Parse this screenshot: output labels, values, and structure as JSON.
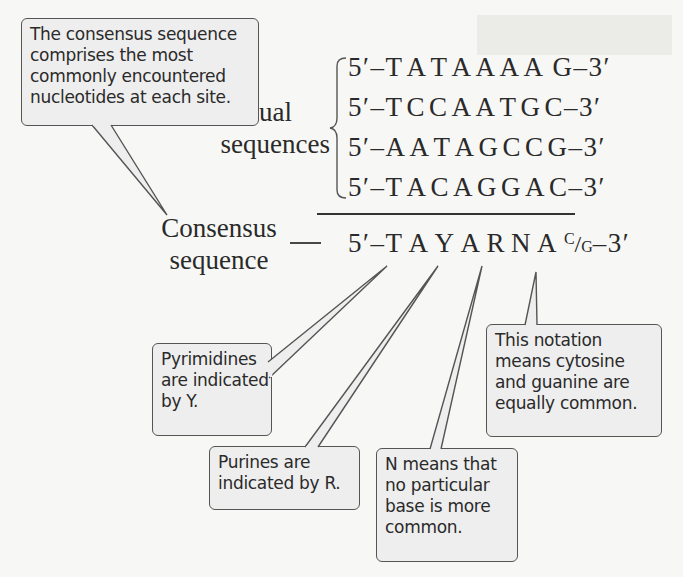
{
  "figure": {
    "top_callout": {
      "lines": [
        "The consensus sequence",
        "comprises the most",
        "commonly encountered",
        "nucleotides at each site."
      ]
    },
    "actual_label": {
      "line1": "Actual",
      "line2": "sequences"
    },
    "actual_sequences": [
      {
        "prefix": "5′–",
        "bases": [
          "T",
          "A",
          "T",
          "A",
          "A",
          "A",
          "A",
          "G"
        ],
        "suffix": "–3′"
      },
      {
        "prefix": "5′–",
        "bases": [
          "T",
          "C",
          "C",
          "A",
          "A",
          "T",
          "G",
          "C"
        ],
        "suffix": "–3′"
      },
      {
        "prefix": "5′–",
        "bases": [
          "A",
          "A",
          "T",
          "A",
          "G",
          "C",
          "C",
          "G"
        ],
        "suffix": "–3′"
      },
      {
        "prefix": "5′–",
        "bases": [
          "T",
          "A",
          "C",
          "A",
          "G",
          "G",
          "A",
          "C"
        ],
        "suffix": "–3′"
      }
    ],
    "consensus_label": {
      "line1": "Consensus",
      "line2": "sequence"
    },
    "consensus_sequence": {
      "prefix": "5′–",
      "bases": [
        "T",
        "A",
        "Y",
        "A",
        "R",
        "N",
        "A"
      ],
      "last_site": {
        "top": "C",
        "slash": "/",
        "bottom": "G"
      },
      "suffix": "–3′"
    },
    "callouts": {
      "pyrimidines": [
        "Pyrimidines",
        "are indicated",
        "by Y."
      ],
      "purines": [
        "Purines are",
        "indicated by R."
      ],
      "n_means": [
        "N means that",
        "no particular",
        "base is more",
        "common."
      ],
      "notation": [
        "This notation",
        "means cytosine",
        "and guanine are",
        "equally common."
      ]
    },
    "colors": {
      "callout_fill": "#eeeeee",
      "callout_border": "#555555",
      "text": "#2a2a2a",
      "page": "#f7f7f5"
    }
  }
}
